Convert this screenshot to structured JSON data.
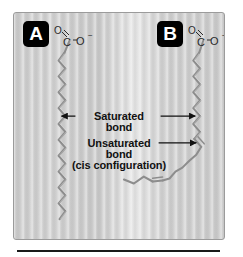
{
  "figure": {
    "title_absent": true,
    "background_color": "#cbcbcb",
    "frame_border_color": "#9b9b9b",
    "panels": [
      {
        "badge": "A",
        "badge_bg": "#000000",
        "badge_fg": "#ffffff",
        "chain_type": "saturated",
        "carboxylate": {
          "o_double": "O",
          "double_bond_glyph": "∕∕",
          "carbon": "C",
          "dash": "-",
          "o_single": "O",
          "charge": "−"
        }
      },
      {
        "badge": "B",
        "badge_bg": "#000000",
        "badge_fg": "#ffffff",
        "chain_type": "unsaturated-cis",
        "carboxylate": {
          "o_double": "O",
          "double_bond_glyph": "∕∕",
          "carbon": "C",
          "dash": "-",
          "o_single": "O",
          "charge": "−"
        }
      }
    ],
    "annotations": [
      {
        "id": "saturated",
        "line1": "Saturated",
        "line2": "bond",
        "line3": "",
        "arrow_left": true,
        "arrow_right": true
      },
      {
        "id": "unsaturated",
        "line1": "Unsaturated",
        "line2": "bond",
        "line3": "(cis configuration)",
        "arrow_left": false,
        "arrow_right": true
      }
    ],
    "chain_color": "#8d8d8d",
    "arrow_color": "#111111",
    "text_color": "#111111"
  },
  "rule": {
    "color": "#1a1a1a"
  }
}
